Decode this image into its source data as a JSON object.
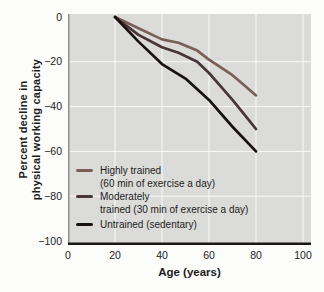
{
  "chart_data": {
    "type": "line",
    "title": "",
    "xlabel": "Age (years)",
    "ylabel": "Percent decline in\nphysical working capacity",
    "xlim": [
      0,
      100
    ],
    "ylim": [
      -100,
      0
    ],
    "x_ticks": [
      0,
      20,
      40,
      60,
      80,
      100
    ],
    "x_tick_labels": [
      "0",
      "20",
      "40",
      "60",
      "80",
      "100"
    ],
    "y_ticks": [
      0,
      -20,
      -40,
      -60,
      -80,
      -100
    ],
    "y_tick_labels": [
      "0",
      "−20",
      "−40",
      "−60",
      "−80",
      "−100"
    ],
    "grid": true,
    "grid_color": "#ffffff",
    "plot_bg_color": "#dbdbd9",
    "axis_spine_color": "#1a1714",
    "left_spine_color": "#8e8e8a",
    "legend_position": "inside bottom-left",
    "series": [
      {
        "name": "Highly trained",
        "label_lines": "Highly trained\n(60 min of exercise a day)",
        "color": "#7a5f58",
        "x": [
          20,
          30,
          40,
          47,
          55,
          60,
          65,
          70,
          75,
          80
        ],
        "y": [
          0,
          -5,
          -10,
          -11.5,
          -15,
          -19,
          -22.5,
          -26,
          -30.5,
          -35
        ]
      },
      {
        "name": "Moderately trained",
        "label_lines": "Moderately\ntrained (30 min of exercise a day)",
        "color": "#483538",
        "x": [
          20,
          30,
          40,
          47,
          55,
          60,
          65,
          70,
          75,
          80
        ],
        "y": [
          0,
          -8,
          -13.5,
          -16,
          -20,
          -25,
          -31,
          -37,
          -43.5,
          -50
        ]
      },
      {
        "name": "Untrained (sedentary)",
        "label_lines": "Untrained (sedentary)",
        "color": "#17120f",
        "x": [
          20,
          30,
          40,
          50,
          60,
          70,
          80
        ],
        "y": [
          0,
          -11,
          -21,
          -27.5,
          -37,
          -49,
          -60
        ]
      }
    ]
  }
}
